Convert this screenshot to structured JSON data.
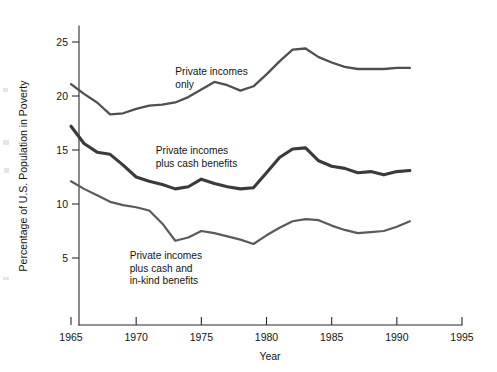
{
  "chart_data": {
    "type": "line",
    "title": "",
    "xlabel": "Year",
    "ylabel": "Percentage of U.S. Population in Poverty",
    "xlim": [
      1965,
      1995
    ],
    "ylim": [
      0,
      27
    ],
    "grid": false,
    "legend_position": "inline-annotations",
    "xticks": [
      1965,
      1970,
      1975,
      1980,
      1985,
      1990,
      1995
    ],
    "xtick_labels": [
      "1965",
      "1970",
      "1975",
      "1980",
      "1985",
      "1990",
      "1995"
    ],
    "yticks": [
      5,
      10,
      15,
      20,
      25
    ],
    "ytick_labels": [
      "5",
      "10",
      "15",
      "20",
      "25"
    ],
    "x": [
      1965,
      1966,
      1967,
      1968,
      1969,
      1970,
      1971,
      1972,
      1973,
      1974,
      1975,
      1976,
      1977,
      1978,
      1979,
      1980,
      1981,
      1982,
      1983,
      1984,
      1985,
      1986,
      1987,
      1988,
      1989,
      1990,
      1991
    ],
    "series": [
      {
        "name": "Private incomes only",
        "color": "#4f4f4f",
        "stroke_width": 2.3,
        "values": [
          21.1,
          20.2,
          19.4,
          18.3,
          18.4,
          18.8,
          19.1,
          19.2,
          19.4,
          19.9,
          20.6,
          21.3,
          21.0,
          20.5,
          20.9,
          22.0,
          23.2,
          24.3,
          24.4,
          23.6,
          23.1,
          22.7,
          22.5,
          22.5,
          22.5,
          22.6,
          22.6
        ]
      },
      {
        "name": "Private incomes plus cash benefits",
        "color": "#3a3a3a",
        "stroke_width": 3.1,
        "values": [
          17.2,
          15.6,
          14.8,
          14.6,
          13.6,
          12.5,
          12.1,
          11.8,
          11.4,
          11.6,
          12.3,
          11.9,
          11.6,
          11.4,
          11.5,
          12.9,
          14.3,
          15.1,
          15.2,
          14.0,
          13.5,
          13.3,
          12.9,
          13.0,
          12.7,
          13.0,
          13.1
        ]
      },
      {
        "name": "Private incomes plus cash and in-kind benefits",
        "color": "#5a5a5a",
        "stroke_width": 2.2,
        "values": [
          12.1,
          11.4,
          10.8,
          10.2,
          9.9,
          9.7,
          9.4,
          8.2,
          6.6,
          6.9,
          7.5,
          7.3,
          7.0,
          6.7,
          6.3,
          7.1,
          7.8,
          8.4,
          8.6,
          8.5,
          8.0,
          7.6,
          7.3,
          7.4,
          7.5,
          7.9,
          8.4
        ]
      }
    ],
    "annotations": [
      {
        "id": "annotation-private-only",
        "lines": [
          "Private incomes",
          "only"
        ],
        "x": 1973.0,
        "y": 21.9
      },
      {
        "id": "annotation-plus-cash",
        "lines": [
          "Private incomes",
          "plus cash benefits"
        ],
        "x": 1971.5,
        "y": 14.6
      },
      {
        "id": "annotation-plus-in-kind",
        "lines": [
          "Private incomes",
          "plus cash and",
          "in-kind benefits"
        ],
        "x": 1969.5,
        "y": 4.9
      }
    ]
  },
  "axes": {
    "y_title": "Percentage of U.S. Population in Poverty",
    "x_title": "Year"
  }
}
